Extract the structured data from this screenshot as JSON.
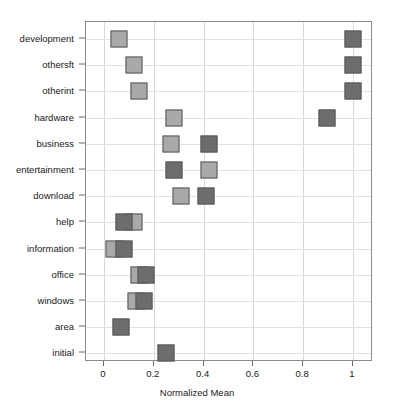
{
  "chart_data": {
    "type": "scatter",
    "title": "",
    "xlabel": "Normalized Mean",
    "ylabel": "",
    "xlim": [
      -0.06,
      1.09
    ],
    "grid": true,
    "legend": "none",
    "xticks": [
      "0",
      "0.2",
      "0.4",
      "0.6",
      "0.8",
      "1"
    ],
    "xtick_values": [
      0,
      0.2,
      0.4,
      0.6,
      0.8,
      1
    ],
    "categories": [
      "development",
      "othersft",
      "otherint",
      "hardware",
      "business",
      "entertainment",
      "download",
      "help",
      "information",
      "office",
      "windows",
      "area",
      "initial"
    ],
    "series": [
      {
        "name": "light-series",
        "color": "#a9a9a9",
        "values": [
          0.06,
          0.12,
          0.14,
          0.28,
          0.27,
          0.42,
          0.31,
          0.12,
          0.04,
          0.14,
          0.13,
          null,
          null
        ]
      },
      {
        "name": "dark-series",
        "color": "#6d6d6d",
        "values": [
          1.0,
          1.0,
          1.0,
          0.895,
          0.42,
          0.28,
          0.41,
          0.08,
          0.08,
          0.17,
          0.16,
          0.07,
          0.25
        ]
      }
    ]
  },
  "axis": {
    "x_title": "Normalized Mean"
  }
}
